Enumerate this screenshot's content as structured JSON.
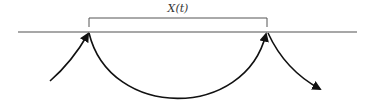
{
  "diagram": {
    "interval_label": "X(t)",
    "colors": {
      "axis_line": "#8a8a8a",
      "bracket": "#555555",
      "arcs": "#111111",
      "label": "#333333"
    }
  }
}
